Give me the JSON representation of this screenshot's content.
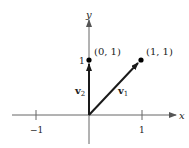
{
  "diagram": {
    "axes": {
      "x_label": "x",
      "y_label": "y",
      "x_ticks": [
        {
          "value": -1,
          "label": "−1"
        },
        {
          "value": 1,
          "label": "1"
        }
      ],
      "y_ticks": [
        {
          "value": 1,
          "label": "1"
        }
      ]
    },
    "points": [
      {
        "coords": [
          0,
          1
        ],
        "label": "(0, 1)"
      },
      {
        "coords": [
          1,
          1
        ],
        "label": "(1, 1)"
      }
    ],
    "vectors": [
      {
        "name": "v1",
        "label_main": "v",
        "label_sub": "1",
        "from": [
          0,
          0
        ],
        "to": [
          1,
          1
        ]
      },
      {
        "name": "v2",
        "label_main": "v",
        "label_sub": "2",
        "from": [
          0,
          0
        ],
        "to": [
          0,
          1
        ]
      }
    ],
    "colors": {
      "axis": "#666666",
      "vector": "#1a1a1a",
      "point": "#000000"
    }
  }
}
